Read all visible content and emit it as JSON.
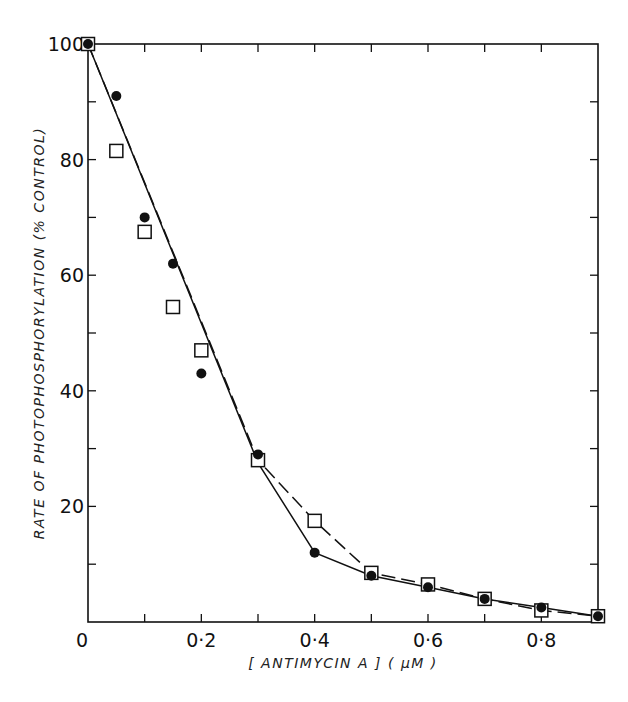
{
  "chart_data": {
    "type": "line",
    "title": "",
    "xlabel": "[ ANTIMYCIN A ] ( μM )",
    "ylabel": "RATE OF PHOTOPHOSPHORYLATION (% CONTROL)",
    "xlim": [
      0,
      0.9
    ],
    "ylim": [
      0,
      100
    ],
    "x_ticks": [
      0,
      0.1,
      0.2,
      0.3,
      0.4,
      0.5,
      0.6,
      0.7,
      0.8
    ],
    "x_tick_labels": [
      {
        "value": 0,
        "label": "0"
      },
      {
        "value": 0.2,
        "label": "0·2"
      },
      {
        "value": 0.4,
        "label": "0·4"
      },
      {
        "value": 0.6,
        "label": "0·6"
      },
      {
        "value": 0.8,
        "label": "0·8"
      }
    ],
    "y_ticks": [
      10,
      20,
      30,
      40,
      50,
      60,
      70,
      80,
      90
    ],
    "y_tick_labels": [
      {
        "value": 100,
        "label": "100"
      },
      {
        "value": 80,
        "label": "80"
      },
      {
        "value": 60,
        "label": "60"
      },
      {
        "value": 40,
        "label": "40"
      },
      {
        "value": 20,
        "label": "20"
      }
    ],
    "grid": false,
    "legend": null,
    "series": [
      {
        "name": "filled circles (solid line)",
        "marker": "filled-circle",
        "line_style": "solid",
        "x": [
          0,
          0.05,
          0.1,
          0.15,
          0.2,
          0.3,
          0.4,
          0.5,
          0.6,
          0.7,
          0.8,
          0.9
        ],
        "values": [
          100,
          91,
          70,
          62,
          43,
          29,
          12,
          8,
          6,
          4,
          2.5,
          1
        ],
        "line_path": [
          [
            0,
            100
          ],
          [
            0.3,
            27.5
          ],
          [
            0.4,
            12
          ],
          [
            0.5,
            8
          ],
          [
            0.6,
            6
          ],
          [
            0.7,
            4
          ],
          [
            0.8,
            2.5
          ],
          [
            0.9,
            1
          ]
        ]
      },
      {
        "name": "open squares (dashed line)",
        "marker": "open-square",
        "line_style": "dashed",
        "x": [
          0,
          0.05,
          0.1,
          0.15,
          0.2,
          0.3,
          0.4,
          0.5,
          0.6,
          0.7,
          0.8,
          0.9
        ],
        "values": [
          100,
          81.5,
          67.5,
          54.5,
          47,
          28,
          17.5,
          8.5,
          6.5,
          4,
          2,
          1
        ],
        "line_path": [
          [
            0,
            100
          ],
          [
            0.3,
            28
          ],
          [
            0.4,
            17.5
          ],
          [
            0.5,
            8.5
          ],
          [
            0.6,
            6.5
          ],
          [
            0.7,
            4
          ],
          [
            0.8,
            2
          ],
          [
            0.9,
            1
          ]
        ]
      }
    ]
  },
  "colors": {
    "ink": "#111111",
    "background": "#ffffff"
  }
}
